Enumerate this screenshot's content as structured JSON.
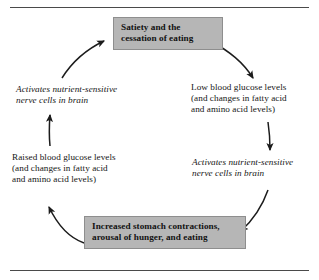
{
  "figure": {
    "layout": "clockwise cycle with six stages",
    "box_fill_color": "#b6b6b6",
    "box_border_color": "#8e8e8e",
    "text_color": "#161616",
    "rule_color": "#4a4a4a",
    "arrow_color": "#1c1c1c"
  },
  "nodes": {
    "satiety": {
      "style": "shaded-box-bold",
      "line1": "Satiety and the",
      "line2": "cessation of eating"
    },
    "low_glucose": {
      "style": "plain-text",
      "line1": "Low blood glucose levels",
      "line2": "(and changes in fatty acid",
      "line3": "and amino acid levels)"
    },
    "activates_right": {
      "style": "italic-text",
      "line1": "Activates nutrient-sensitive",
      "line2": "nerve cells in brain"
    },
    "eating": {
      "style": "shaded-box-bold",
      "line1": "Increased stomach contractions,",
      "line2": "arousal of hunger, and eating"
    },
    "raised_glucose": {
      "style": "plain-text",
      "line1": "Raised blood glucose levels",
      "line2": "(and changes in fatty acid",
      "line3": "and amino acid levels)"
    },
    "activates_left": {
      "style": "italic-text",
      "line1": "Activates nutrient-sensitive",
      "line2": "nerve cells in brain"
    }
  },
  "arrows": [
    {
      "name": "satiety-to-low-glucose",
      "from": "satiety",
      "to": "low_glucose",
      "direction": "curves down-right"
    },
    {
      "name": "low-glucose-to-activates-right",
      "from": "low_glucose",
      "to": "activates_right",
      "direction": "down"
    },
    {
      "name": "activates-right-to-eating",
      "from": "activates_right",
      "to": "eating",
      "direction": "curves down-left"
    },
    {
      "name": "eating-to-raised-glucose",
      "from": "eating",
      "to": "raised_glucose",
      "direction": "curves up-left"
    },
    {
      "name": "raised-glucose-to-activates-left",
      "from": "raised_glucose",
      "to": "activates_left",
      "direction": "up"
    },
    {
      "name": "activates-left-to-satiety",
      "from": "activates_left",
      "to": "satiety",
      "direction": "curves up-right"
    }
  ]
}
